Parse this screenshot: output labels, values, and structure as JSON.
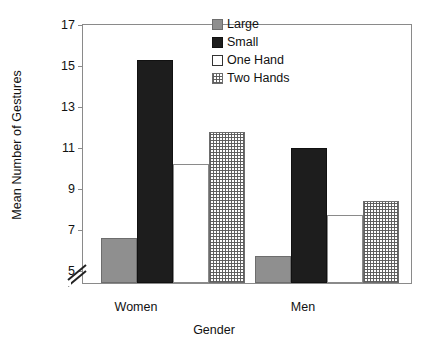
{
  "chart_data": {
    "type": "bar",
    "title": "",
    "xlabel": "Gender",
    "ylabel": "Mean Number of Gestures",
    "categories": [
      "Women",
      "Men"
    ],
    "yticks": [
      5,
      7,
      9,
      11,
      13,
      15,
      17
    ],
    "ylim": [
      4.3,
      17
    ],
    "axis_break": true,
    "grid": false,
    "legend_position": "top-right",
    "series": [
      {
        "name": "Large",
        "swatch": "gray",
        "color": "#8f8f8f",
        "values": [
          6.5,
          5.6
        ]
      },
      {
        "name": "Small",
        "swatch": "black",
        "color": "#1d1d1d",
        "values": [
          15.2,
          10.9
        ]
      },
      {
        "name": "One Hand",
        "swatch": "white",
        "color": "#ffffff",
        "values": [
          10.1,
          7.6
        ]
      },
      {
        "name": "Two Hands",
        "swatch": "hatched",
        "color": "#b0b0b0",
        "values": [
          11.7,
          8.3
        ]
      }
    ]
  },
  "legend": {
    "items": [
      {
        "label": "Large"
      },
      {
        "label": "Small"
      },
      {
        "label": "One Hand"
      },
      {
        "label": "Two Hands"
      }
    ]
  },
  "axis": {
    "y_title": "Mean Number of Gestures",
    "x_title": "Gender",
    "y_tick_labels": [
      "17",
      "15",
      "13",
      "11",
      "9",
      "7",
      "5"
    ],
    "x_tick_labels": [
      "Women",
      "Men"
    ]
  }
}
